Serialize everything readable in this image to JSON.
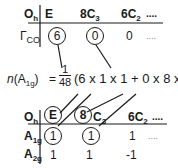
{
  "top_table": {
    "corner": "O",
    "corner_sub": "h",
    "headers": [
      {
        "label": "E"
      },
      {
        "label": "8C",
        "sub": "3"
      },
      {
        "label": "6C",
        "sub": "2"
      },
      {
        "label": "...."
      }
    ],
    "row": {
      "label": "Γ",
      "label_sub": "CO",
      "values": [
        "6",
        "0",
        "0",
        "...."
      ]
    },
    "circled_indices": [
      0,
      1
    ]
  },
  "formula": {
    "lhs_italic": "n",
    "lhs_rest": "(A",
    "lhs_sub": "1g",
    "lhs_close": ")",
    "equals": "=",
    "frac_num": "1",
    "frac_den": "48",
    "rhs": "(6 x 1 x 1 + 0 x 8 x 1 ...."
  },
  "bottom_table": {
    "corner": "O",
    "corner_sub": "h",
    "headers": [
      {
        "label": "E",
        "circled": true
      },
      {
        "label": "8",
        "circled": true,
        "suffix": "C",
        "sub": "3"
      },
      {
        "label": "6C",
        "sub": "2"
      },
      {
        "label": "...."
      }
    ],
    "rows": [
      {
        "label": "A",
        "label_sub": "1g",
        "values": [
          "1",
          "1",
          "1",
          "...."
        ],
        "circled_indices": [
          0,
          1
        ]
      },
      {
        "label": "A",
        "label_sub": "2g",
        "values": [
          "1",
          "1",
          "-1"
        ]
      }
    ]
  },
  "colors": {
    "ink": "#1a1a1a",
    "background": "#ffffff"
  }
}
